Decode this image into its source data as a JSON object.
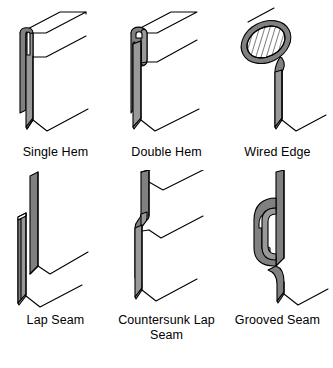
{
  "figure": {
    "background_color": "#ffffff",
    "line_color": "#000000",
    "metal_fill": "#808080",
    "metal_face_fill": "#ffffff",
    "wire_hatch_color": "#000000",
    "rows": 2,
    "columns": 3
  },
  "items": [
    {
      "id": "single-hem",
      "label": "Single Hem",
      "row": 1,
      "column": 1,
      "description": "Sheet edge folded back once into a narrow closed loop at the top"
    },
    {
      "id": "double-hem",
      "label": "Double Hem",
      "row": 1,
      "column": 2,
      "description": "Sheet edge folded back twice forming a deeper U shaped hem"
    },
    {
      "id": "wired-edge",
      "label": "Wired Edge",
      "row": 1,
      "column": 3,
      "description": "Sheet edge wrapped around a round wire shown in section hatching"
    },
    {
      "id": "lap-seam",
      "label": "Lap Seam",
      "row": 2,
      "column": 1,
      "description": "Two flat sheets overlapping face to face"
    },
    {
      "id": "countersunk-lap-seam",
      "label": "Countersunk Lap Seam",
      "row": 2,
      "column": 2,
      "description": "Lap seam with one sheet offset so the surfaces lie flush"
    },
    {
      "id": "grooved-seam",
      "label": "Grooved Seam",
      "row": 2,
      "column": 3,
      "description": "Two folded hooks interlocked and flattened into a grooved joint"
    }
  ]
}
